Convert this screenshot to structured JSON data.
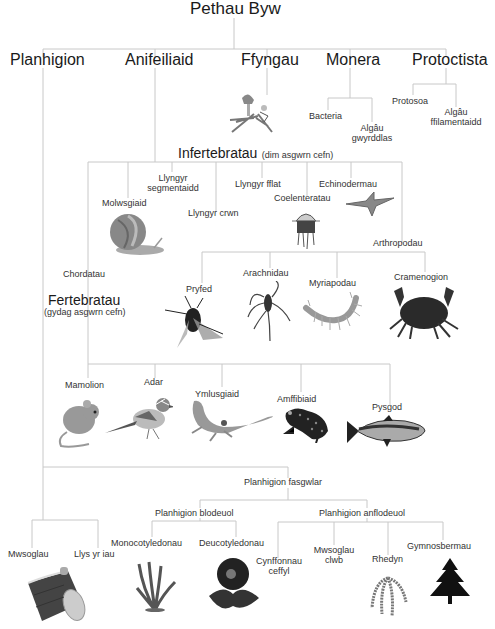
{
  "root": "Pethau Byw",
  "kingdoms": [
    "Planhigion",
    "Anifeiliaid",
    "Ffyngau",
    "Monera",
    "Protoctista"
  ],
  "monera": [
    "Bacteria",
    "Algâu gwyrddlas"
  ],
  "protoctista": [
    "Protosoa",
    "Algâu ffilamentaidd"
  ],
  "invertebrates": {
    "title": "Infertebratau",
    "subtitle": "(dim asgwrn cefn)",
    "groups": [
      "Molwsgiaid",
      "Llyngyr segmentaidd",
      "Llyngyr crwn",
      "Llyngyr fflat",
      "Coelenteratau",
      "Echinodermau",
      "Arthropodau"
    ]
  },
  "arthropods": [
    "Pryfed",
    "Arachnidau",
    "Myriapodau",
    "Cramenogion"
  ],
  "chordates": "Chordatau",
  "vertebrates": {
    "title": "Fertebratau",
    "subtitle": "(gydag asgwrn cefn)",
    "groups": [
      "Mamolion",
      "Adar",
      "Ymlusgiaid",
      "Amffibiaid",
      "Pysgod"
    ]
  },
  "plants": {
    "non_vascular": [
      "Mwsoglau",
      "Llys yr iau"
    ],
    "vascular": "Planhigion fasgwlar",
    "flowering": "Planhigion blodeuol",
    "flowering_groups": [
      "Monocotyledonau",
      "Deucotyledonau"
    ],
    "non_flowering": "Planhigion anflodeuol",
    "non_flowering_groups": [
      "Cynffonnau ceffyl",
      "Mwsoglau clwb",
      "Rhedyn",
      "Gymnosbermau"
    ]
  }
}
